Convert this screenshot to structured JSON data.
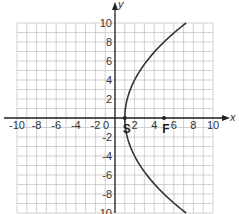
{
  "chart_data": {
    "type": "line",
    "title": "",
    "xlabel": "x",
    "ylabel": "y",
    "xlim": [
      -10,
      10
    ],
    "ylim": [
      -10,
      10
    ],
    "grid": true,
    "grid_step": 1,
    "x_ticks": [
      "-10",
      "-8",
      "-6",
      "-4",
      "-2",
      "0",
      "2",
      "4",
      "6",
      "8",
      "10"
    ],
    "y_ticks": [
      "10",
      "8",
      "6",
      "4",
      "2",
      "-2",
      "-4",
      "-6",
      "-8",
      "-10"
    ],
    "series": [
      {
        "name": "parabola",
        "equation": "y^2 = 16(x - 1)",
        "x": [
          7.25,
          5.0,
          3.25,
          2.0,
          1.25,
          1.0,
          1.25,
          2.0,
          3.25,
          5.0,
          7.25
        ],
        "y": [
          10,
          8,
          6,
          4,
          2,
          0,
          -2,
          -4,
          -6,
          -8,
          -10
        ]
      }
    ],
    "points": [
      {
        "label": "S",
        "x": 1,
        "y": 0
      },
      {
        "label": "F",
        "x": 5,
        "y": 0
      }
    ]
  },
  "colors": {
    "grid": "#bdbdbd",
    "axis": "#222222",
    "curve": "#333333"
  }
}
